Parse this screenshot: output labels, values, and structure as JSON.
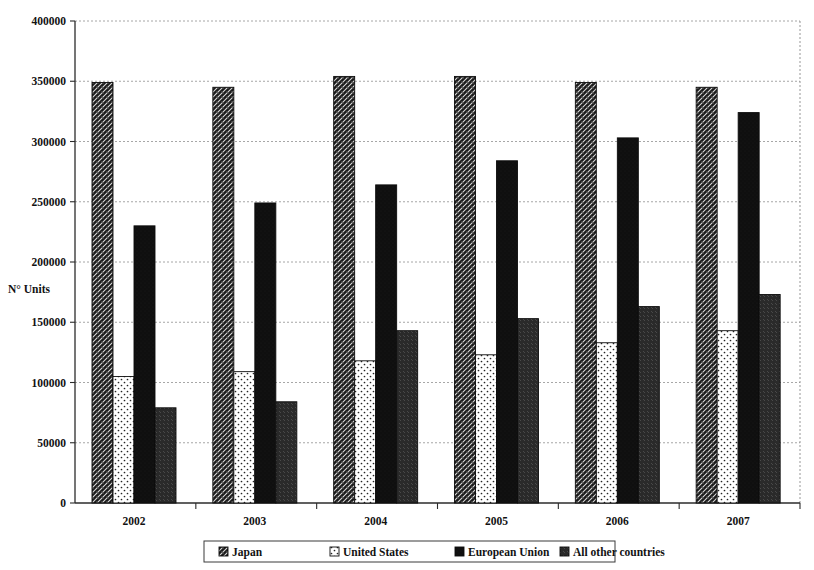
{
  "chart_data": {
    "type": "bar",
    "title": "",
    "subtitle": "",
    "xlabel": "",
    "ylabel": "N° Units",
    "categories": [
      "2002",
      "2003",
      "2004",
      "2005",
      "2006",
      "2007"
    ],
    "ylim": [
      0,
      400000
    ],
    "ytick_step": 50000,
    "yticks": [
      "0",
      "50000",
      "100000",
      "150000",
      "200000",
      "250000",
      "300000",
      "350000",
      "400000"
    ],
    "ytick_values": [
      0,
      50000,
      100000,
      150000,
      200000,
      250000,
      300000,
      350000,
      400000
    ],
    "grid": true,
    "legend_position": "bottom",
    "series": [
      {
        "name": "Japan",
        "pattern": "dark-weave-hatch",
        "color": "#1c1c1c",
        "values": [
          349000,
          345000,
          354000,
          354000,
          349000,
          345000
        ]
      },
      {
        "name": "United States",
        "pattern": "white-dotted",
        "color": "#ffffff",
        "values": [
          105000,
          109000,
          118000,
          123000,
          133000,
          143000
        ]
      },
      {
        "name": "European Union",
        "pattern": "solid-black",
        "color": "#0d0d0d",
        "values": [
          230000,
          249000,
          264000,
          284000,
          303000,
          324000
        ]
      },
      {
        "name": "All other countries",
        "pattern": "diagonal-hatch",
        "color": "#6e6e6e",
        "values": [
          79000,
          84000,
          143000,
          153000,
          163000,
          173000
        ]
      }
    ]
  },
  "legend": {
    "items": [
      {
        "label": "Japan",
        "swatch": "dark-weave-hatch"
      },
      {
        "label": "United States",
        "swatch": "white-dotted"
      },
      {
        "label": "European Union",
        "swatch": "solid-black"
      },
      {
        "label": "All other countries",
        "swatch": "diagonal-hatch"
      }
    ]
  },
  "axis": {
    "y_title": "N° Units"
  },
  "colors": {
    "background": "#ffffff",
    "axis": "#2b2b2b",
    "grid": "#7d7d7d",
    "text": "#121212",
    "series_japan": "#1c1c1c",
    "series_united_states": "#ffffff",
    "series_european_union": "#0d0d0d",
    "series_all_other": "#6e6e6e"
  }
}
